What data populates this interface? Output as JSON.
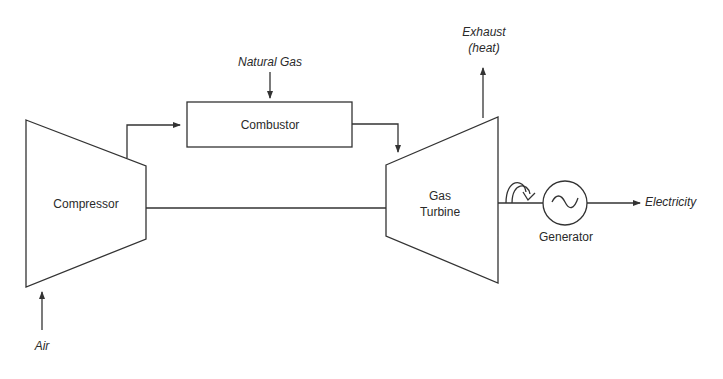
{
  "diagram": {
    "type": "gas-turbine-flow-diagram",
    "components": {
      "compressor": "Compressor",
      "combustor": "Combustor",
      "turbine_line1": "Gas",
      "turbine_line2": "Turbine",
      "generator": "Generator"
    },
    "flows": {
      "air": "Air",
      "fuel": "Natural Gas",
      "exhaust_line1": "Exhaust",
      "exhaust_line2": "(heat)",
      "output": "Electricity"
    },
    "colors": {
      "stroke": "#333333",
      "text": "#2a2a2a"
    }
  }
}
